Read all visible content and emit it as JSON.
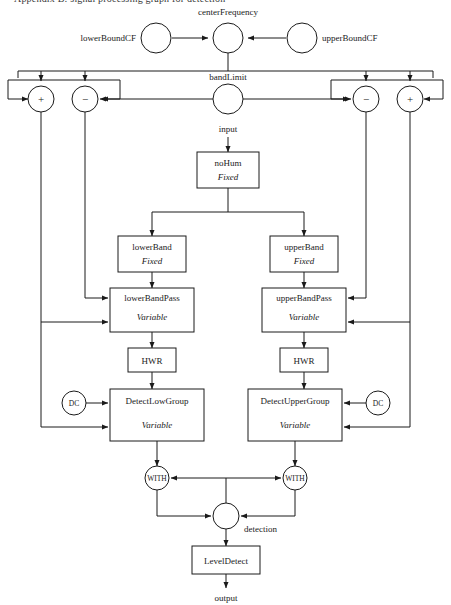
{
  "page": {
    "clipped_header": "Appendix B: signal processing graph for detection",
    "background_color": "#ffffff",
    "line_color": "#1a1a1a"
  },
  "signals": {
    "center_frequency": "centerFrequency",
    "lower_bound_cf": "lowerBoundCF",
    "upper_bound_cf": "upperBoundCF",
    "band_limit": "bandLimit",
    "input": "input",
    "detection": "detection",
    "output": "output"
  },
  "operators": {
    "left_plus": "+",
    "left_minus": "−",
    "right_minus": "−",
    "right_plus": "+"
  },
  "circles": {
    "dc_left": "DC",
    "dc_right": "DC",
    "with_left": "WITH",
    "with_right": "WITH"
  },
  "blocks": [
    {
      "id": "nohum",
      "title": "noHum",
      "subtitle": "Fixed"
    },
    {
      "id": "lower-band",
      "title": "lowerBand",
      "subtitle": "Fixed"
    },
    {
      "id": "upper-band",
      "title": "upperBand",
      "subtitle": "Fixed"
    },
    {
      "id": "lower-band-pass",
      "title": "lowerBandPass",
      "subtitle": "Variable"
    },
    {
      "id": "upper-band-pass",
      "title": "upperBandPass",
      "subtitle": "Variable"
    },
    {
      "id": "hwr-left",
      "title": "HWR",
      "subtitle": ""
    },
    {
      "id": "hwr-right",
      "title": "HWR",
      "subtitle": ""
    },
    {
      "id": "detect-low",
      "title": "DetectLowGroup",
      "subtitle": "Variable"
    },
    {
      "id": "detect-upper",
      "title": "DetectUpperGroup",
      "subtitle": "Variable"
    },
    {
      "id": "level-detect",
      "title": "LevelDetect",
      "subtitle": ""
    }
  ]
}
